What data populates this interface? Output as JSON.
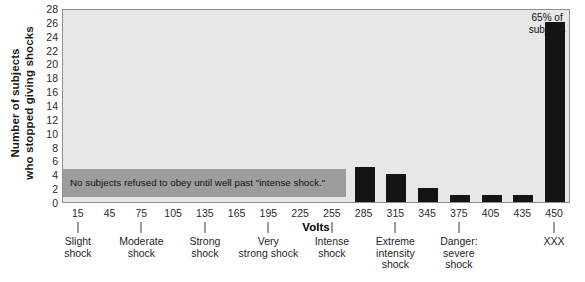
{
  "chart_data": {
    "type": "bar",
    "title": "",
    "xlabel": "Volts",
    "ylabel_line1": "Number of subjects",
    "ylabel_line2": "who stopped giving shocks",
    "categories": [
      "15",
      "45",
      "75",
      "105",
      "135",
      "165",
      "195",
      "225",
      "255",
      "285",
      "315",
      "345",
      "375",
      "405",
      "435",
      "450"
    ],
    "values": [
      0,
      0,
      0,
      0,
      0,
      0,
      0,
      0,
      0,
      5,
      4,
      2,
      1,
      1,
      1,
      26
    ],
    "ylim": [
      0,
      28
    ],
    "ytick_values": [
      0,
      2,
      4,
      6,
      8,
      10,
      12,
      14,
      16,
      18,
      20,
      22,
      24,
      26,
      28
    ],
    "ytick_labels": [
      "0",
      "2",
      "4",
      "6",
      "8",
      "10",
      "12",
      "14",
      "16",
      "18",
      "20",
      "22",
      "24",
      "26",
      "28"
    ],
    "grid": false,
    "legend": "none",
    "bar_color": "#141414",
    "plot_background": "#e7e7e7",
    "note_color": "#9d9d9d",
    "group_labels": [
      {
        "volt": "15",
        "line1": "Slight",
        "line2": "shock",
        "line3": ""
      },
      {
        "volt": "75",
        "line1": "Moderate",
        "line2": "shock",
        "line3": ""
      },
      {
        "volt": "135",
        "line1": "Strong",
        "line2": "shock",
        "line3": ""
      },
      {
        "volt": "195",
        "line1": "Very",
        "line2": "strong shock",
        "line3": ""
      },
      {
        "volt": "255",
        "line1": "Intense",
        "line2": "shock",
        "line3": ""
      },
      {
        "volt": "315",
        "line1": "Extreme",
        "line2": "intensity",
        "line3": "shock"
      },
      {
        "volt": "375",
        "line1": "Danger:",
        "line2": "severe",
        "line3": "shock"
      },
      {
        "volt": "450",
        "line1": "XXX",
        "line2": "",
        "line3": ""
      }
    ],
    "annotations": [
      {
        "id": "note",
        "text": "No subjects refused to obey until well past \"intense shock.\""
      },
      {
        "id": "callout",
        "line1": "65% of",
        "line2": "subjects"
      }
    ]
  }
}
